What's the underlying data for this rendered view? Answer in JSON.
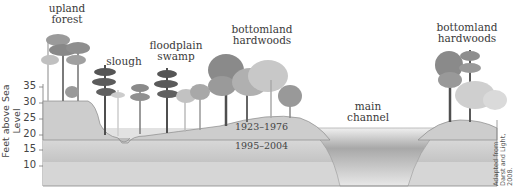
{
  "diagram": {
    "title": "",
    "y_axis": {
      "label": "Feet above Sea Level",
      "ticks": [
        "35",
        "30",
        "25",
        "20",
        "15",
        "10"
      ]
    },
    "zones": [
      {
        "label_line1": "upland",
        "label_line2": "forest"
      },
      {
        "label_line1": "slough",
        "label_line2": ""
      },
      {
        "label_line1": "floodplain",
        "label_line2": "swamp"
      },
      {
        "label_line1": "bottomland",
        "label_line2": "hardwoods"
      },
      {
        "label_line1": "main",
        "label_line2": "channel"
      },
      {
        "label_line1": "bottomland",
        "label_line2": "hardwoods"
      }
    ],
    "water_levels": [
      {
        "period": "1923–1976",
        "elevation_ft": 21.5
      },
      {
        "period": "1995–2004",
        "elevation_ft": 18
      }
    ],
    "credit": {
      "line1": "Adapted from",
      "line2": "Darst and Light,",
      "line3": "2008."
    },
    "colors": {
      "ground": "#cfcfcf",
      "ground_edge": "#9a9a9a",
      "water_old": "#dcdcdc",
      "water_new": "#b8b8b8",
      "channel": "#8f8f8f",
      "tree_dark": "#5a5a5a",
      "tree_light": "#b5b5b5"
    }
  }
}
